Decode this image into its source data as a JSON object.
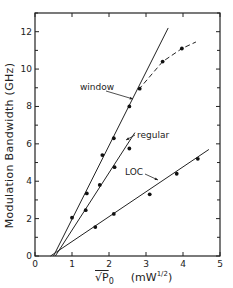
{
  "chart_data": {
    "type": "scatter",
    "title": "",
    "xlabel": "√P₀ (mW^1/2)",
    "ylabel": "Modulation Bandwidth (GHz)",
    "xlim": [
      0,
      5
    ],
    "ylim": [
      0,
      13
    ],
    "xticks": [
      0,
      1,
      2,
      3,
      4,
      5
    ],
    "yticks": [
      0,
      2,
      4,
      6,
      8,
      10,
      12
    ],
    "grid": false,
    "legend": "inline annotations with leader lines",
    "series": [
      {
        "name": "window",
        "marker": "filled circle",
        "points": [
          [
            1.0,
            2.05
          ],
          [
            1.4,
            3.35
          ],
          [
            1.82,
            5.4
          ],
          [
            2.13,
            6.3
          ],
          [
            2.55,
            8.0
          ],
          [
            2.83,
            8.95
          ],
          [
            3.45,
            10.4
          ],
          [
            3.97,
            11.1
          ]
        ],
        "fit_line": [
          [
            0.5,
            0.0
          ],
          [
            3.6,
            12.2
          ]
        ],
        "saturation_curve_dashed": [
          [
            2.8,
            8.9
          ],
          [
            3.45,
            10.4
          ],
          [
            3.97,
            11.1
          ],
          [
            4.35,
            11.45
          ]
        ]
      },
      {
        "name": "regular",
        "marker": "filled circle",
        "points": [
          [
            1.37,
            2.45
          ],
          [
            1.75,
            3.8
          ],
          [
            2.15,
            4.75
          ],
          [
            2.55,
            5.75
          ]
        ],
        "fit_line": [
          [
            0.55,
            0.0
          ],
          [
            2.7,
            6.6
          ]
        ]
      },
      {
        "name": "LOC",
        "marker": "filled circle",
        "points": [
          [
            1.63,
            1.55
          ],
          [
            2.13,
            2.25
          ],
          [
            3.1,
            3.3
          ],
          [
            3.83,
            4.4
          ],
          [
            4.4,
            5.2
          ]
        ],
        "fit_line": [
          [
            0.42,
            0.0
          ],
          [
            4.7,
            5.7
          ]
        ]
      }
    ],
    "annotations": [
      {
        "text": "window",
        "x": 1.2,
        "y": 8.9
      },
      {
        "text": "regular",
        "x": 2.75,
        "y": 6.3
      },
      {
        "text": "LOC",
        "x": 2.45,
        "y": 4.6
      }
    ]
  },
  "labels": {
    "ylabel": "Modulation Bandwidth  (GHz)",
    "xlabel_main": "√P",
    "xlabel_sub": "0",
    "xlabel_units": "(mW",
    "xlabel_exp": "1/2",
    "xlabel_close": ")",
    "window": "window",
    "regular": "regular",
    "loc": "LOC"
  },
  "tick_labels": {
    "x": [
      "0",
      "1",
      "2",
      "3",
      "4",
      "5"
    ],
    "y": [
      "0",
      "2",
      "4",
      "6",
      "8",
      "10",
      "12"
    ]
  }
}
